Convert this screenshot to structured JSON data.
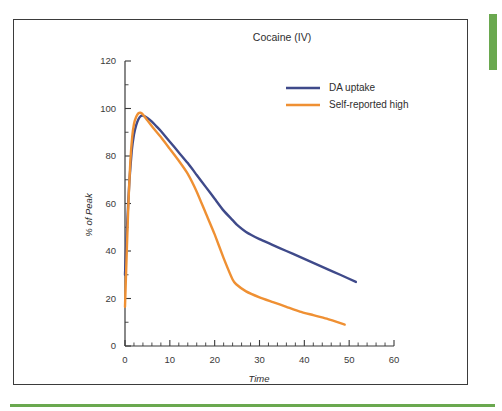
{
  "figure": {
    "title": "Cocaine (IV)",
    "border_color": "#3b3b3b",
    "accent_color": "#6aa84f"
  },
  "chart_data": {
    "type": "line",
    "title": "Cocaine (IV)",
    "xlabel": "Time",
    "ylabel": "% of Peak",
    "xlim": [
      0,
      60
    ],
    "ylim": [
      0,
      120
    ],
    "xticks": [
      0,
      10,
      20,
      30,
      40,
      50,
      60
    ],
    "xtick_labels": [
      "0",
      "10",
      "20",
      "30",
      "40",
      "50",
      "60"
    ],
    "x_minor_tick_step": 2,
    "yticks": [
      0,
      20,
      40,
      60,
      80,
      100,
      120
    ],
    "ytick_labels": [
      "0",
      "20",
      "40",
      "60",
      "80",
      "100",
      "120"
    ],
    "y_minor_tick_step": 10,
    "grid": false,
    "legend_position": "upper-right",
    "series": [
      {
        "name": "DA uptake",
        "color": "#3f4a8a",
        "x": [
          0,
          0.5,
          1,
          1.5,
          2,
          2.5,
          3,
          3.5,
          4,
          5,
          6,
          7,
          8,
          10,
          12,
          14,
          16,
          18,
          20,
          22,
          24,
          25,
          27,
          30,
          33,
          36,
          39,
          42,
          45,
          48,
          51.5
        ],
        "y": [
          30,
          52,
          70,
          82,
          89,
          93,
          95.5,
          96.8,
          97,
          96,
          94.5,
          92.5,
          90.5,
          86,
          81.5,
          77,
          72,
          67,
          62,
          57,
          53,
          51,
          48,
          45,
          42.5,
          40,
          37.5,
          35,
          32.5,
          30,
          27
        ]
      },
      {
        "name": "Self-reported high",
        "color": "#ef9033",
        "x": [
          0,
          0.4,
          0.8,
          1.2,
          1.6,
          2,
          2.5,
          3,
          3.5,
          4,
          5,
          6,
          8,
          10,
          12,
          14,
          16,
          18,
          20,
          22,
          24,
          24.8,
          27,
          30,
          33,
          36,
          39,
          42,
          45,
          49
        ],
        "y": [
          16.5,
          40,
          62,
          78,
          88,
          93.5,
          96.5,
          98,
          98.2,
          97.5,
          95,
          92.5,
          88,
          83,
          78,
          72.5,
          65,
          56,
          47,
          37,
          28,
          26,
          23,
          20.5,
          18.5,
          16.5,
          14.5,
          13,
          11.5,
          9
        ]
      }
    ]
  },
  "legend": {
    "items": [
      {
        "label": "DA uptake",
        "color": "#3f4a8a"
      },
      {
        "label": "Self-reported high",
        "color": "#ef9033"
      }
    ]
  }
}
